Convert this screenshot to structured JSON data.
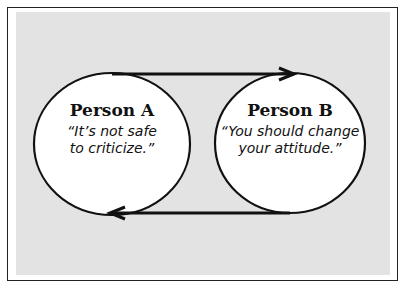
{
  "diagram": {
    "nodes": [
      {
        "name": "Person A",
        "quote": "“It’s not safe to criticize.”",
        "quote_lines": [
          "“It’s not safe",
          "to criticize.”"
        ]
      },
      {
        "name": "Person B",
        "quote": "“You should change your attitude.”",
        "quote_lines": [
          "“You should change",
          "your attitude.”"
        ]
      }
    ],
    "edges": [
      {
        "from": "Person A",
        "to": "Person B",
        "position": "top"
      },
      {
        "from": "Person B",
        "to": "Person A",
        "position": "bottom"
      }
    ],
    "colors": {
      "panel": "#e3e3e3",
      "node_fill": "#ffffff",
      "stroke": "#111111"
    }
  }
}
